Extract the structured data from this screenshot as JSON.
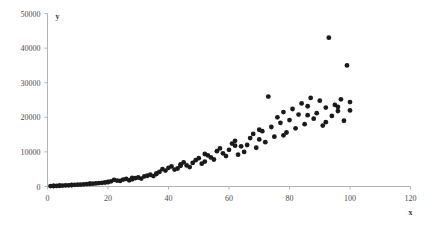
{
  "chart_data": {
    "type": "scatter",
    "title": "",
    "xlabel": "x",
    "ylabel": "y",
    "xlim": [
      0,
      120
    ],
    "ylim": [
      0,
      50000
    ],
    "xticks": [
      0,
      20,
      40,
      60,
      80,
      100,
      120
    ],
    "xtick_labels": [
      "0",
      "20",
      "40",
      "60",
      "80",
      "100",
      "120"
    ],
    "yticks": [
      0,
      10000,
      20000,
      30000,
      40000,
      50000
    ],
    "ytick_labels": [
      "0",
      "10000",
      "20000",
      "30000",
      "40000",
      "50000"
    ],
    "grid": false,
    "legend": null,
    "marker": {
      "shape": "circle",
      "color": "#1a1a1a",
      "size": 2.4
    },
    "axis_color": "#b3b3b3",
    "points": [
      [
        1,
        120
      ],
      [
        2,
        150
      ],
      [
        3,
        180
      ],
      [
        4,
        210
      ],
      [
        5,
        260
      ],
      [
        6,
        300
      ],
      [
        7,
        340
      ],
      [
        8,
        400
      ],
      [
        9,
        470
      ],
      [
        10,
        520
      ],
      [
        11,
        560
      ],
      [
        12,
        620
      ],
      [
        13,
        700
      ],
      [
        14,
        760
      ],
      [
        15,
        820
      ],
      [
        16,
        900
      ],
      [
        17,
        980
      ],
      [
        18,
        1050
      ],
      [
        19,
        1150
      ],
      [
        20,
        1250
      ],
      [
        21,
        1500
      ],
      [
        22,
        1900
      ],
      [
        23,
        1700
      ],
      [
        24,
        1600
      ],
      [
        25,
        2000
      ],
      [
        26,
        2200
      ],
      [
        27,
        1800
      ],
      [
        28,
        2100
      ],
      [
        29,
        2400
      ],
      [
        30,
        2600
      ],
      [
        31,
        2300
      ],
      [
        32,
        2900
      ],
      [
        33,
        3100
      ],
      [
        34,
        3400
      ],
      [
        35,
        3000
      ],
      [
        36,
        3600
      ],
      [
        37,
        4200
      ],
      [
        38,
        5000
      ],
      [
        39,
        4600
      ],
      [
        40,
        5400
      ],
      [
        41,
        5800
      ],
      [
        42,
        4900
      ],
      [
        43,
        5200
      ],
      [
        44,
        6400
      ],
      [
        45,
        7000
      ],
      [
        46,
        6100
      ],
      [
        47,
        5600
      ],
      [
        48,
        6800
      ],
      [
        49,
        7600
      ],
      [
        50,
        8200
      ],
      [
        51,
        6600
      ],
      [
        52,
        7200
      ],
      [
        53,
        9000
      ],
      [
        54,
        8400
      ],
      [
        55,
        7800
      ],
      [
        56,
        10200
      ],
      [
        57,
        11000
      ],
      [
        58,
        9600
      ],
      [
        59,
        8800
      ],
      [
        60,
        10600
      ],
      [
        61,
        12400
      ],
      [
        62,
        13200
      ],
      [
        63,
        9200
      ],
      [
        64,
        11600
      ],
      [
        65,
        10000
      ],
      [
        66,
        12000
      ],
      [
        67,
        14000
      ],
      [
        68,
        15200
      ],
      [
        69,
        11200
      ],
      [
        70,
        13600
      ],
      [
        71,
        16000
      ],
      [
        72,
        12800
      ],
      [
        73,
        26000
      ],
      [
        74,
        17200
      ],
      [
        75,
        14400
      ],
      [
        76,
        20000
      ],
      [
        77,
        18400
      ],
      [
        78,
        21500
      ],
      [
        79,
        15600
      ],
      [
        80,
        19200
      ],
      [
        81,
        22400
      ],
      [
        82,
        16800
      ],
      [
        83,
        20800
      ],
      [
        84,
        24000
      ],
      [
        85,
        18000
      ],
      [
        86,
        23200
      ],
      [
        87,
        25600
      ],
      [
        88,
        19600
      ],
      [
        89,
        21200
      ],
      [
        90,
        24800
      ],
      [
        91,
        17600
      ],
      [
        92,
        22800
      ],
      [
        93,
        43000
      ],
      [
        94,
        20400
      ],
      [
        95,
        23600
      ],
      [
        96,
        21800
      ],
      [
        97,
        25200
      ],
      [
        98,
        19000
      ],
      [
        99,
        35000
      ],
      [
        100,
        22000
      ],
      [
        100,
        24400
      ],
      [
        44,
        6000
      ],
      [
        52,
        9400
      ],
      [
        62,
        11800
      ],
      [
        70,
        16400
      ],
      [
        78,
        14800
      ],
      [
        86,
        20600
      ],
      [
        92,
        18600
      ],
      [
        96,
        23000
      ],
      [
        36,
        3800
      ],
      [
        28,
        2500
      ],
      [
        20,
        1350
      ],
      [
        14,
        800
      ],
      [
        8,
        430
      ],
      [
        4,
        230
      ],
      [
        2,
        160
      ]
    ]
  }
}
